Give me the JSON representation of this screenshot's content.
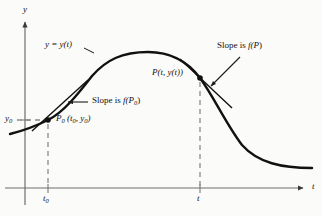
{
  "figure": {
    "kind": "math-diagram",
    "background_color": "#fbfbf9",
    "ink_color": "#111111",
    "dash_color": "#8a8a8a",
    "axis_color": "#6e6e6e"
  },
  "axes": {
    "y_axis_label": "y",
    "x_axis_label": "t",
    "origin_px": {
      "x": 25,
      "y": 188
    },
    "y_axis_top_px": 18,
    "x_axis_right_px": 308
  },
  "ticks": [
    {
      "name": "t0",
      "label": "t",
      "subscript": "0",
      "x_px": 48
    },
    {
      "name": "t",
      "label": "t",
      "subscript": "",
      "x_px": 200
    }
  ],
  "value_labels": [
    {
      "name": "y0",
      "label": "y",
      "subscript": "0",
      "y_px": 120
    }
  ],
  "curve": {
    "label": "y = y(t)",
    "label_px": {
      "x": 45,
      "y": 45
    },
    "stroke_width": 2.4,
    "path": "M 10,134 C 22,131 34,127 48,120 C 64,112 78,94 92,76 C 106,60 122,52 148,52 C 172,52 188,62 200,78 C 214,97 226,124 242,145 C 258,163 282,168 312,168"
  },
  "points": [
    {
      "name": "P0",
      "label": "P",
      "subscript": "0",
      "coords_text": "(t , y )",
      "coords_full": "P0 (t0, y0)",
      "px": {
        "x": 48,
        "y": 120
      },
      "label_px": {
        "x": 56,
        "y": 119
      },
      "tangent": {
        "label_prefix": "Slope is",
        "label_fn": "f(P",
        "label_sub": "0",
        "label_suffix": ")",
        "label_px": {
          "x": 92,
          "y": 99
        },
        "line": {
          "x1": 32,
          "y1": 131,
          "x2": 88,
          "y2": 80
        },
        "leader": {
          "x1": 88,
          "y1": 102,
          "x2": 68,
          "y2": 102
        }
      }
    },
    {
      "name": "P",
      "label": "P",
      "subscript": "",
      "coords_text": "(t, y(t))",
      "coords_full": "P(t, y(t))",
      "px": {
        "x": 200,
        "y": 78
      },
      "label_px": {
        "x": 152,
        "y": 74
      },
      "tangent": {
        "label_prefix": "Slope is",
        "label_fn": "f(P",
        "label_sub": "",
        "label_suffix": ")",
        "label_px": {
          "x": 217,
          "y": 47
        },
        "line": {
          "x1": 180,
          "y1": 59,
          "x2": 232,
          "y2": 108
        },
        "leader": {
          "x1": 240,
          "y1": 57,
          "x2": 211,
          "y2": 86
        }
      }
    }
  ],
  "dashed_guides": [
    {
      "name": "t0-vertical",
      "x1": 48,
      "y1": 124,
      "x2": 48,
      "y2": 188
    },
    {
      "name": "t-vertical",
      "x1": 200,
      "y1": 82,
      "x2": 200,
      "y2": 188
    },
    {
      "name": "y0-horizontal",
      "x1": 18,
      "y1": 120,
      "x2": 48,
      "y2": 120
    }
  ]
}
